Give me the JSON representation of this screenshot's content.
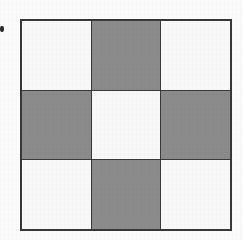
{
  "figure": {
    "name": "checkerboard-3x3",
    "border_color": "#353535",
    "grid_line_color": "#3a3a3a",
    "light_color": "#f8f8f8",
    "dark_color": "#8b8b8b",
    "background_color": "#fbfbfb",
    "rows": 3,
    "columns": 3,
    "cells": [
      [
        {
          "id": "r1c1",
          "fill": "light",
          "label": ""
        },
        {
          "id": "r1c2",
          "fill": "dark",
          "label": ""
        },
        {
          "id": "r1c3",
          "fill": "light",
          "label": ""
        }
      ],
      [
        {
          "id": "r2c1",
          "fill": "dark",
          "label": ""
        },
        {
          "id": "r2c2",
          "fill": "light",
          "label": ""
        },
        {
          "id": "r2c3",
          "fill": "dark",
          "label": ""
        }
      ],
      [
        {
          "id": "r3c1",
          "fill": "light",
          "label": ""
        },
        {
          "id": "r3c2",
          "fill": "dark",
          "label": ""
        },
        {
          "id": "r3c3",
          "fill": "light",
          "label": ""
        }
      ]
    ]
  },
  "marker": {
    "name": "margin-dot",
    "color": "#2a2a2a",
    "label": ""
  }
}
